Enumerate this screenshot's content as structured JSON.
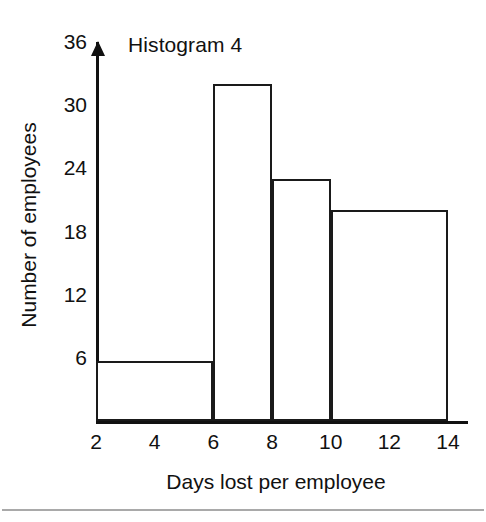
{
  "chart_data": {
    "type": "bar",
    "title": "Histogram 4",
    "xlabel": "Days lost per employee",
    "ylabel": "Number of employees",
    "xlim": [
      2,
      14
    ],
    "ylim": [
      0,
      36
    ],
    "grid": false,
    "legend": null,
    "xticks": [
      "2",
      "4",
      "6",
      "8",
      "10",
      "12",
      "14"
    ],
    "xtick_values": [
      2,
      4,
      6,
      8,
      10,
      12,
      14
    ],
    "yticks": [
      "6",
      "12",
      "18",
      "24",
      "30",
      "36"
    ],
    "ytick_values": [
      6,
      12,
      18,
      24,
      30,
      36
    ],
    "bin_edges": [
      2,
      6,
      8,
      10,
      14
    ],
    "categories": [
      "2-6",
      "6-8",
      "8-10",
      "10-14"
    ],
    "values": [
      5.7,
      32,
      23,
      20
    ],
    "bars": [
      {
        "label": "2-6",
        "x0": 2,
        "x1": 6,
        "value": 5.7
      },
      {
        "label": "6-8",
        "x0": 6,
        "x1": 8,
        "value": 32
      },
      {
        "label": "8-10",
        "x0": 8,
        "x1": 10,
        "value": 23
      },
      {
        "label": "10-14",
        "x0": 10,
        "x1": 14,
        "value": 20
      }
    ],
    "colors": {
      "bar_fill": "#ffffff",
      "bar_stroke": "#1a1a1a",
      "axis": "#111111",
      "text": "#111111",
      "background": "#ffffff",
      "page_rule": "#9a9a9a"
    }
  }
}
